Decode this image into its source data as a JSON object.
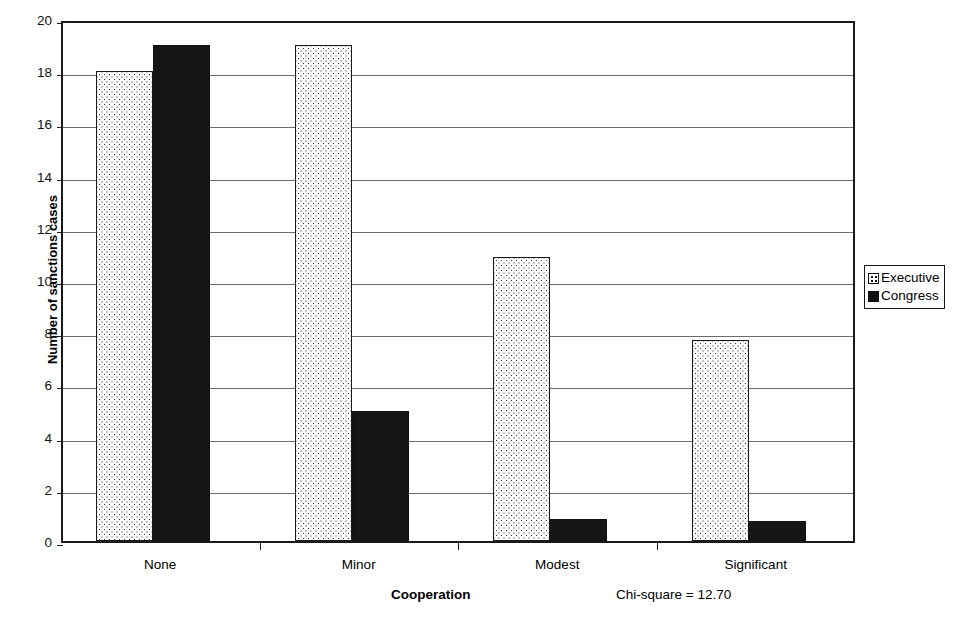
{
  "chart_data": {
    "type": "bar",
    "title": "",
    "subtitle": "",
    "categories": [
      "None",
      "Minor",
      "Modest",
      "Significant"
    ],
    "series": [
      {
        "name": "Executive",
        "values": [
          18.0,
          19.0,
          10.9,
          7.7
        ],
        "pattern": "dotted",
        "color": "#ffffff"
      },
      {
        "name": "Congress",
        "values": [
          19.0,
          5.0,
          0.85,
          0.75
        ],
        "pattern": "solid",
        "color": "#151515"
      }
    ],
    "xlabel": "Cooperation",
    "ylabel": "Number of sanctions cases",
    "ylim": [
      0,
      20
    ],
    "yticks": [
      0,
      2,
      4,
      6,
      8,
      10,
      12,
      14,
      16,
      18,
      20
    ],
    "ytick_labels": [
      "0",
      "2",
      "4",
      "6",
      "8",
      "10",
      "12",
      "14",
      "16",
      "18",
      "20"
    ],
    "grid": true,
    "grid_axis": "y",
    "legend_position": "right",
    "legend_entries": [
      "Executive",
      "Congress"
    ],
    "annotations": [
      {
        "text": "Chi-square = 12.70",
        "position": "below-axis-right"
      }
    ]
  },
  "axis": {
    "y_title": "Number of sanctions cases",
    "x_title": "Cooperation"
  },
  "annotation": {
    "chi_square": "Chi-square = 12.70"
  },
  "legend": {
    "executive": "Executive",
    "congress": "Congress"
  }
}
